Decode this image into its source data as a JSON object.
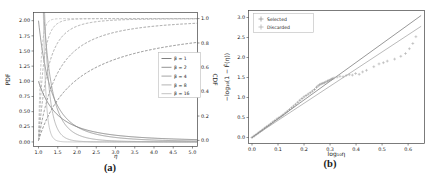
{
  "figure": {
    "background": "#ffffff",
    "captions": {
      "a": "(a)",
      "b": "(b)"
    }
  },
  "chart_data": [
    {
      "id": "a",
      "type": "line",
      "title": "",
      "xlabel": "η",
      "ylabel_left": "PDF",
      "ylabel_right": "CDF",
      "xlim": [
        0.87,
        5.13
      ],
      "ylim_left": [
        -0.075,
        2.135
      ],
      "ylim_right": [
        -0.05,
        1.05
      ],
      "xticks": [
        "1.0",
        "1.5",
        "2.0",
        "2.5",
        "3.0",
        "3.5",
        "4.0",
        "4.5",
        "5.0"
      ],
      "yticks_left": [
        "0.00",
        "0.25",
        "0.50",
        "0.75",
        "1.00",
        "1.25",
        "1.50",
        "1.75",
        "2.00"
      ],
      "yticks_right": [
        "0.0",
        "0.2",
        "0.4",
        "0.6",
        "0.8",
        "1.0"
      ],
      "grid": false,
      "legend_position": "center right",
      "series_model": {
        "family": "pareto",
        "support_min": 1.0,
        "betas": [
          1,
          2,
          4,
          8,
          16
        ],
        "pdf_formula": "f(η) = β·η^−(β+1), η ≥ 1  (solid, left axis)",
        "cdf_formula": "F(η) = 1 − η^−β  (dashed, right axis)"
      },
      "legend": {
        "entries": [
          {
            "label": "β = 1",
            "color": "#5f5f5f"
          },
          {
            "label": "β = 2",
            "color": "#787878"
          },
          {
            "label": "β = 4",
            "color": "#8e8e8e"
          },
          {
            "label": "β = 8",
            "color": "#a1a1a1"
          },
          {
            "label": "β = 16",
            "color": "#b3b3b3"
          }
        ]
      }
    },
    {
      "id": "b",
      "type": "scatter",
      "title": "",
      "xlabel": "log₁₀η",
      "ylabel": "−log₁₀(1 − F̂(η))",
      "xlim": [
        -0.0135,
        0.663
      ],
      "ylim": [
        -0.15,
        3.175
      ],
      "xticks": [
        "0.0",
        "0.1",
        "0.2",
        "0.3",
        "0.4",
        "0.5",
        "0.6"
      ],
      "yticks": [
        "0.0",
        "0.5",
        "1.0",
        "1.5",
        "2.0",
        "2.5",
        "3.0"
      ],
      "grid": false,
      "legend_position": "upper left",
      "lines": [
        {
          "name": "reference-line-steep",
          "x": [
            0.0,
            0.65
          ],
          "y": [
            0.0,
            3.05
          ],
          "color": "#7e7e7e"
        },
        {
          "name": "reference-line-shallow",
          "x": [
            0.0,
            0.65
          ],
          "y": [
            0.0,
            2.78
          ],
          "color": "#a8a8a8"
        }
      ],
      "series": [
        {
          "name": "Selected",
          "marker": "+",
          "color": "#8a8a8a",
          "points": [
            [
              0.0,
              0.0
            ],
            [
              0.008,
              0.038
            ],
            [
              0.016,
              0.076
            ],
            [
              0.024,
              0.114
            ],
            [
              0.032,
              0.152
            ],
            [
              0.04,
              0.19
            ],
            [
              0.048,
              0.232
            ],
            [
              0.056,
              0.27
            ],
            [
              0.064,
              0.305
            ],
            [
              0.072,
              0.342
            ],
            [
              0.08,
              0.384
            ],
            [
              0.088,
              0.425
            ],
            [
              0.096,
              0.462
            ],
            [
              0.104,
              0.497
            ],
            [
              0.112,
              0.53
            ],
            [
              0.12,
              0.57
            ],
            [
              0.128,
              0.612
            ],
            [
              0.136,
              0.655
            ],
            [
              0.144,
              0.7
            ],
            [
              0.152,
              0.742
            ],
            [
              0.16,
              0.785
            ],
            [
              0.168,
              0.83
            ],
            [
              0.176,
              0.88
            ],
            [
              0.184,
              0.93
            ],
            [
              0.192,
              0.975
            ],
            [
              0.2,
              1.015
            ],
            [
              0.208,
              1.05
            ],
            [
              0.216,
              1.085
            ],
            [
              0.224,
              1.12
            ],
            [
              0.232,
              1.16
            ],
            [
              0.24,
              1.2
            ],
            [
              0.248,
              1.255
            ],
            [
              0.254,
              1.29
            ],
            [
              0.26,
              1.32
            ],
            [
              0.266,
              1.34
            ],
            [
              0.272,
              1.355
            ],
            [
              0.278,
              1.37
            ],
            [
              0.284,
              1.39
            ],
            [
              0.29,
              1.41
            ],
            [
              0.297,
              1.43
            ],
            [
              0.304,
              1.45
            ],
            [
              0.31,
              1.47
            ]
          ]
        },
        {
          "name": "Discarded",
          "marker": "+",
          "color": "#a9a9a9",
          "points": [
            [
              0.295,
              1.42
            ],
            [
              0.305,
              1.46
            ],
            [
              0.315,
              1.49
            ],
            [
              0.327,
              1.51
            ],
            [
              0.338,
              1.53
            ],
            [
              0.35,
              1.52
            ],
            [
              0.362,
              1.55
            ],
            [
              0.374,
              1.57
            ],
            [
              0.386,
              1.56
            ],
            [
              0.398,
              1.6
            ],
            [
              0.412,
              1.58
            ],
            [
              0.425,
              1.64
            ],
            [
              0.44,
              1.68
            ],
            [
              0.468,
              1.77
            ],
            [
              0.488,
              1.84
            ],
            [
              0.505,
              1.87
            ],
            [
              0.52,
              1.91
            ],
            [
              0.548,
              1.96
            ],
            [
              0.572,
              2.03
            ],
            [
              0.59,
              2.1
            ],
            [
              0.605,
              2.22
            ],
            [
              0.618,
              2.35
            ],
            [
              0.63,
              2.52
            ]
          ]
        }
      ]
    }
  ]
}
